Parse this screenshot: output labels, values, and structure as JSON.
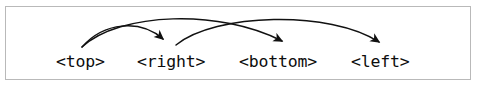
{
  "figure": {
    "kind": "arrow-diagram",
    "background_color": "#ffffff",
    "border_color": "#b9b9b9",
    "stroke_color": "#111111"
  },
  "nodes": [
    {
      "id": "top",
      "label": "<top>"
    },
    {
      "id": "right",
      "label": "<right>"
    },
    {
      "id": "bottom",
      "label": "<bottom>"
    },
    {
      "id": "left",
      "label": "<left>"
    }
  ],
  "arrows": [
    {
      "id": "top-to-right",
      "from": "top",
      "to": "right",
      "shape": "arc-over",
      "arrowhead": "down"
    },
    {
      "id": "top-to-bottom",
      "from": "top",
      "to": "bottom",
      "shape": "arc-over",
      "arrowhead": "down-right"
    },
    {
      "id": "right-to-left",
      "from": "right",
      "to": "left",
      "shape": "arc-over",
      "arrowhead": "down-right"
    }
  ]
}
